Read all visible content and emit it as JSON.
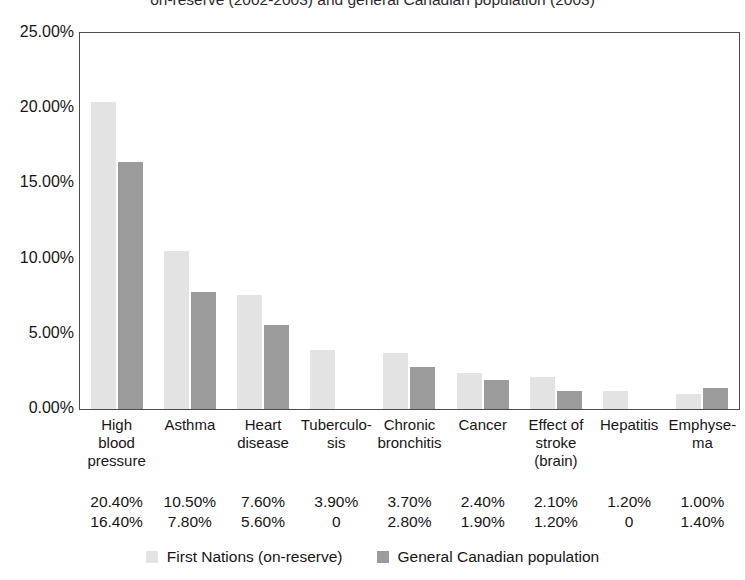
{
  "chart_data": {
    "type": "bar",
    "title": "on-reserve (2002-2003) and general Canadian population (2003)",
    "xlabel": "",
    "ylabel": "",
    "ylim": [
      0,
      25
    ],
    "ytick_labels": [
      "25.00%",
      "20.00%",
      "15.00%",
      "10.00%",
      "5.00%",
      "0.00%"
    ],
    "ytick_values": [
      25,
      20,
      15,
      10,
      5,
      0
    ],
    "grid": false,
    "legend_position": "bottom",
    "categories": [
      "High blood pressure",
      "Asthma",
      "Heart disease",
      "Tuberculo- sis",
      "Chronic bronchitis",
      "Cancer",
      "Effect of stroke (brain)",
      "Hepatitis",
      "Emphyse- ma"
    ],
    "category_lines": [
      [
        "High",
        "blood",
        "pressure"
      ],
      [
        "Asthma"
      ],
      [
        "Heart",
        "disease"
      ],
      [
        "Tuberculo-",
        "sis"
      ],
      [
        "Chronic",
        "bronchitis"
      ],
      [
        "Cancer"
      ],
      [
        "Effect of",
        "stroke",
        "(brain)"
      ],
      [
        "Hepatitis"
      ],
      [
        "Emphyse-",
        "ma"
      ]
    ],
    "series": [
      {
        "name": "First Nations (on-reserve)",
        "color": "#e3e3e3",
        "values": [
          20.4,
          10.5,
          7.6,
          3.9,
          3.7,
          2.4,
          2.1,
          1.2,
          1.0
        ],
        "labels": [
          "20.40%",
          "10.50%",
          "7.60%",
          "3.90%",
          "3.70%",
          "2.40%",
          "2.10%",
          "1.20%",
          "1.00%"
        ]
      },
      {
        "name": "General Canadian population",
        "color": "#9b9b9b",
        "values": [
          16.4,
          7.8,
          5.6,
          0,
          2.8,
          1.9,
          1.2,
          0,
          1.4
        ],
        "labels": [
          "16.40%",
          "7.80%",
          "5.60%",
          "0",
          "2.80%",
          "1.90%",
          "1.20%",
          "0",
          "1.40%"
        ]
      }
    ]
  }
}
